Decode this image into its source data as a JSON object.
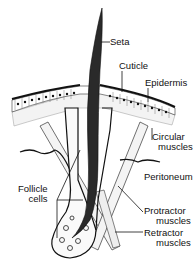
{
  "diagram": {
    "labels": {
      "seta": "Seta",
      "cuticle": "Cuticle",
      "epidermis": "Epidermis",
      "circular_line1": "Circular",
      "circular_line2": "muscles",
      "peritoneum": "Peritoneum",
      "follicle_line1": "Follicle",
      "follicle_line2": "cells",
      "protractor_line1": "Protractor",
      "protractor_line2": "muscles",
      "retractor_line1": "Retractor",
      "retractor_line2": "muscles"
    },
    "colors": {
      "ink": "#111111",
      "background": "#ffffff",
      "seta": "#2a2a2a"
    }
  }
}
